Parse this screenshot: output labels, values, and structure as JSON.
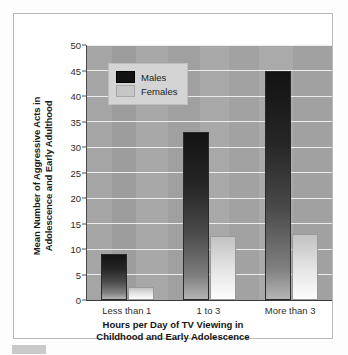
{
  "chart_data": {
    "type": "bar",
    "title": "",
    "categories": [
      "Less than 1",
      "1 to 3",
      "More than 3"
    ],
    "series": [
      {
        "name": "Males",
        "values": [
          9,
          33,
          45
        ],
        "color": "#121212"
      },
      {
        "name": "Females",
        "values": [
          2.5,
          12.5,
          13
        ],
        "color": "#c6c6c6"
      }
    ],
    "xlabel": "Hours per Day of TV Viewing in Childhood and Early Adolescence",
    "ylabel": "Mean Number of Aggressive Acts in Adolescence and Early Adulthood",
    "ylim": [
      0,
      50
    ],
    "ytick_step": 5,
    "yticks": [
      "0",
      "5",
      "10",
      "15",
      "20",
      "25",
      "30",
      "35",
      "40",
      "45",
      "50"
    ],
    "grid": true,
    "legend_position": "top-left"
  },
  "axes": {
    "ylabel_line1": "Mean Number of Aggressive Acts in",
    "ylabel_line2": "Adolescence and Early Adulthood",
    "xlabel_line1": "Hours per Day of TV Viewing in",
    "xlabel_line2": "Childhood and Early Adolescence"
  },
  "legend": {
    "items": [
      {
        "label": "Males"
      },
      {
        "label": "Females"
      }
    ]
  },
  "colors": {
    "plot_background": "#a5a5a5",
    "gridline": "#efefef",
    "male_bar": "#121212",
    "female_bar": "#c6c6c6",
    "card_background": "#ffffff",
    "card_border": "#b9b9b9"
  }
}
